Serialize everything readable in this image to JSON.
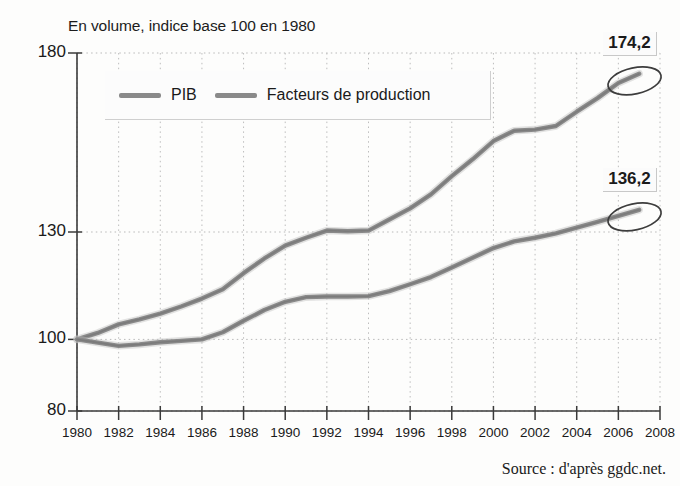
{
  "chart_data": {
    "type": "line",
    "title": "En volume, indice base 100 en 1980",
    "xlabel": "",
    "ylabel": "",
    "xlim": [
      1980,
      2008
    ],
    "ylim": [
      80,
      180
    ],
    "grid": true,
    "legend_position": "top-left-inside",
    "y_ticks": [
      180,
      130,
      100,
      80
    ],
    "y_tick_labels": [
      "180",
      "130",
      "100",
      "80"
    ],
    "x_ticks": [
      1980,
      1982,
      1984,
      1986,
      1988,
      1990,
      1992,
      1994,
      1996,
      1998,
      2000,
      2002,
      2004,
      2006,
      2008
    ],
    "x_tick_labels": [
      "1980",
      "1982",
      "1984",
      "1986",
      "1988",
      "1990",
      "1992",
      "1994",
      "1996",
      "1998",
      "2000",
      "2002",
      "2004",
      "2006",
      "2008"
    ],
    "x": [
      1980,
      1981,
      1982,
      1983,
      1984,
      1985,
      1986,
      1987,
      1988,
      1989,
      1990,
      1991,
      1992,
      1993,
      1994,
      1995,
      1996,
      1997,
      1998,
      1999,
      2000,
      2001,
      2002,
      2003,
      2004,
      2005,
      2006,
      2007
    ],
    "series": [
      {
        "name": "PIB",
        "color": "#8a8a8a",
        "values": [
          100.0,
          101.8,
          104.2,
          105.6,
          107.2,
          109.2,
          111.4,
          114.0,
          118.5,
          122.6,
          126.2,
          128.4,
          130.4,
          130.2,
          130.4,
          133.5,
          136.6,
          140.5,
          145.6,
          150.3,
          155.4,
          158.3,
          158.6,
          159.6,
          163.6,
          167.4,
          171.6,
          174.2
        ]
      },
      {
        "name": "Facteurs de production",
        "color": "#8a8a8a",
        "values": [
          100.0,
          99.1,
          98.2,
          98.6,
          99.2,
          99.6,
          100.0,
          102.0,
          105.2,
          108.2,
          110.5,
          111.8,
          112.0,
          112.0,
          112.1,
          113.5,
          115.4,
          117.4,
          120.1,
          122.8,
          125.5,
          127.4,
          128.4,
          129.6,
          131.2,
          132.8,
          134.5,
          136.2
        ]
      }
    ],
    "annotations": [
      {
        "text": "174,2",
        "series": "PIB",
        "x": 2007,
        "y": 174.2,
        "marker": "ellipse"
      },
      {
        "text": "136,2",
        "series": "Facteurs de production",
        "x": 2007,
        "y": 136.2,
        "marker": "ellipse"
      }
    ]
  },
  "source": {
    "text": "Source : d'après ggdc.net."
  }
}
